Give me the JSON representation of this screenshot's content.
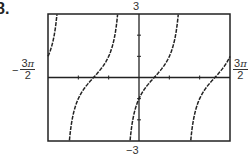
{
  "problem": {
    "number": "8."
  },
  "window": {
    "ymax_label": "3",
    "ymin_label": "−3",
    "xmin_label": {
      "sign": "−",
      "numerator": "3",
      "pi": "π",
      "denominator": "2"
    },
    "xmax_label": {
      "numerator": "3",
      "pi": "π",
      "denominator": "2"
    }
  },
  "chart_data": {
    "type": "line",
    "title": "",
    "function": "y = tan(x − π/4)",
    "xlabel": "",
    "ylabel": "",
    "xlim": [
      -4.712,
      4.712
    ],
    "ylim": [
      -3,
      3
    ],
    "x_tick_labels": [
      "−3π/2",
      "3π/2"
    ],
    "y_tick_labels": [
      "−3",
      "3"
    ],
    "x_tick_spacing": "π/2",
    "y_tick_spacing": 1,
    "grid": false,
    "legend": null,
    "zeros": [
      "−3π/4",
      "π/4",
      "5π/4"
    ],
    "vertical_asymptotes": [
      "−5π/4",
      "−π/4",
      "3π/4"
    ],
    "series": [
      {
        "name": "tan(x − π/4)",
        "branches": [
          {
            "x_range": [
              "−3π/2",
              "−5π/4"
            ]
          },
          {
            "x_range": [
              "−5π/4",
              "−π/4"
            ]
          },
          {
            "x_range": [
              "−π/4",
              "3π/4"
            ]
          },
          {
            "x_range": [
              "3π/4",
              "3π/2"
            ]
          }
        ]
      }
    ],
    "colors": {
      "curve": "#222222",
      "frame": "#222222",
      "axes": "#222222"
    }
  }
}
